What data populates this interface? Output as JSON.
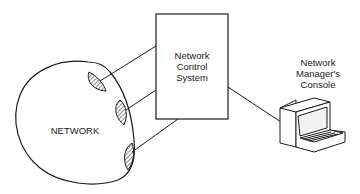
{
  "diagram": {
    "network": {
      "label": "NETWORK"
    },
    "control_system": {
      "line1": "Network",
      "line2": "Control",
      "line3": "System"
    },
    "console": {
      "line1": "Network",
      "line2": "Manager's",
      "line3": "Console"
    },
    "connections": [
      {
        "from": "network-attachment-1",
        "to": "control-system"
      },
      {
        "from": "network-attachment-2",
        "to": "control-system"
      },
      {
        "from": "network-attachment-3",
        "to": "control-system"
      },
      {
        "from": "control-system",
        "to": "console"
      }
    ],
    "colors": {
      "stroke": "#1a1a1a",
      "background": "#ffffff"
    }
  }
}
